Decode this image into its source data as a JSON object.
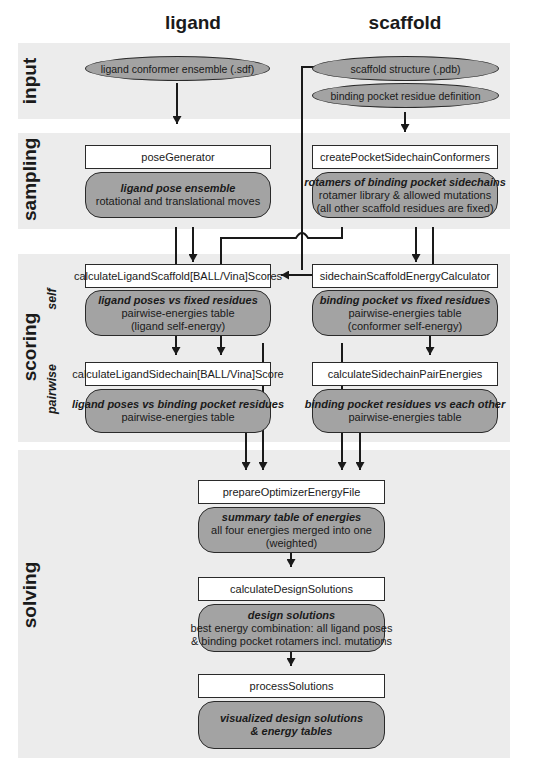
{
  "columns": {
    "ligand": "ligand",
    "scaffold": "scaffold"
  },
  "stages": {
    "input": "input",
    "sampling": "sampling",
    "scoring": "scoring",
    "scoring_self": "self",
    "scoring_pairwise": "pairwise",
    "solving": "solving"
  },
  "input": {
    "ligand_ellipse": "ligand conformer ensemble (.sdf)",
    "scaffold_ellipse": "scaffold structure (.pdb)",
    "pocket_ellipse": "binding pocket residue definition"
  },
  "sampling": {
    "ligand_process": "poseGenerator",
    "ligand_result": {
      "title": "ligand pose ensemble",
      "lines": [
        "rotational and translational moves"
      ]
    },
    "scaffold_process": "createPocketSidechainConformers",
    "scaffold_result": {
      "title": "rotamers of binding pocket sidechains",
      "lines": [
        "rotamer library & allowed mutations",
        "(all other scaffold residues are fixed)"
      ]
    }
  },
  "scoring": {
    "self_ligand_process": "calculateLigandScaffold[BALL/Vina]Scores",
    "self_ligand_result": {
      "title": "ligand poses vs fixed residues",
      "lines": [
        "pairwise-energies table",
        "(ligand self-energy)"
      ]
    },
    "self_scaffold_process": "sidechainScaffoldEnergyCalculator",
    "self_scaffold_result": {
      "title": "binding pocket vs fixed residues",
      "lines": [
        "pairwise-energies table",
        "(conformer self-energy)"
      ]
    },
    "pair_ligand_process": "calculateLigandSidechain[BALL/Vina]Score",
    "pair_ligand_result": {
      "title": "ligand poses vs binding pocket residues",
      "lines": [
        "pairwise-energies table"
      ]
    },
    "pair_scaffold_process": "calculateSidechainPairEnergies",
    "pair_scaffold_result": {
      "title": "binding pocket residues vs each other",
      "lines": [
        "pairwise-energies table"
      ]
    }
  },
  "solving": {
    "prepare_process": "prepareOptimizerEnergyFile",
    "prepare_result": {
      "title": "summary table of energies",
      "lines": [
        "all four energies merged into one",
        "(weighted)"
      ]
    },
    "design_process": "calculateDesignSolutions",
    "design_result": {
      "title": "design solutions",
      "lines": [
        "best energy combination: all ligand poses",
        "& binding pocket rotamers incl. mutations"
      ]
    },
    "post_process": "processSolutions",
    "post_result": {
      "title": "visualized design solutions",
      "lines": [
        "& energy tables"
      ]
    }
  },
  "colors": {
    "band": "#ececec",
    "result_fill": "#a3a3a3",
    "stroke": "#1a1a1a"
  }
}
